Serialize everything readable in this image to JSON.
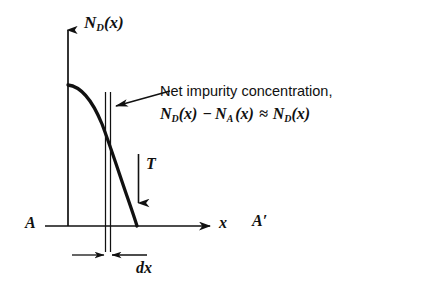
{
  "figure": {
    "background_color": "#ffffff",
    "ink_color": "#111111"
  },
  "axes": {
    "y_axis": {
      "name": "vertical-axis",
      "label_main": "N",
      "label_sub": "D",
      "label_arg": "(x)",
      "label_full": "N_D(x)",
      "x_px": 68,
      "top_px": 26,
      "bottom_px": 226,
      "arrow": "up"
    },
    "x_axis": {
      "name": "horizontal-axis",
      "label": "x",
      "y_px": 226,
      "left_px": 45,
      "right_px": 214,
      "arrow": "right"
    },
    "left_end_label": "A",
    "right_end_label": "A′"
  },
  "curve": {
    "name": "impurity-concentration-curve",
    "description": "monotonically decreasing complementary-error-function-like diffusion profile",
    "start_x_px": 68,
    "start_y_px": 85,
    "end_x_px": 137,
    "end_y_px": 226,
    "stroke_width": 3.2
  },
  "slab": {
    "name": "differential-slab-dx",
    "left_line_x_px": 105,
    "right_line_x_px": 110,
    "top_px": 92,
    "bottom_px": 252,
    "width_label": "dx",
    "dimension_line_y_px": 255,
    "dimension_left_start_px": 70,
    "dimension_right_end_px": 150
  },
  "annotations": {
    "net_impurity": {
      "name": "net-impurity-annotation",
      "line1": "Net impurity concentration,",
      "line2_parts": {
        "nd1": "N",
        "nd1_sub": "D",
        "nd1_arg": "(x)",
        "minus": "−",
        "na": "N",
        "na_sub": "A",
        "na_arg": "(x)",
        "approx": "≈",
        "nd2": "N",
        "nd2_sub": "D",
        "nd2_arg": "(x)"
      },
      "line2_full": "N_D(x) − N_A(x) ≈ N_D(x)",
      "leader_arrow": {
        "from_x_px": 168,
        "from_y_px": 92,
        "to_x_px": 114,
        "to_y_px": 106,
        "direction": "left"
      }
    },
    "thickness_arrow": {
      "name": "thickness-arrow-T",
      "label": "T",
      "x_px": 138,
      "top_y_px": 154,
      "bottom_y_px": 206,
      "direction": "down"
    }
  }
}
